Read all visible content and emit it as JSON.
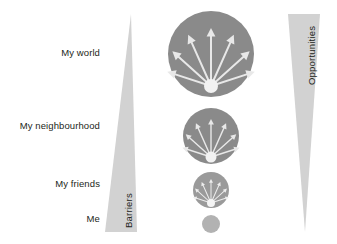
{
  "diagram": {
    "background_color": "#ffffff",
    "labels": {
      "my_world": "My world",
      "my_neighbourhood": "My neighbourhood",
      "my_friends": "My friends",
      "me": "Me"
    },
    "triangles": {
      "barriers": {
        "label": "Barriers",
        "color": "#d2d2d2",
        "orientation": "apex-top",
        "description": "narrow at top, widening toward bottom"
      },
      "opportunities": {
        "label": "Opportunities",
        "color": "#d2d2d2",
        "orientation": "apex-bottom",
        "description": "wide at top, narrowing toward bottom"
      }
    },
    "circles": [
      {
        "level": "my-world",
        "cx": 211,
        "cy": 54,
        "r": 43,
        "color": "#8a8a8a",
        "arrow_count": 7,
        "arrow_color": "#e8e8e8",
        "hub_color": "#f2f2f2",
        "has_arrows": true
      },
      {
        "level": "my-neighbourhood",
        "cx": 211,
        "cy": 136,
        "r": 28,
        "color": "#8a8a8a",
        "arrow_count": 7,
        "arrow_color": "#e8e8e8",
        "hub_color": "#f2f2f2",
        "has_arrows": true
      },
      {
        "level": "my-friends",
        "cx": 211,
        "cy": 190,
        "r": 18,
        "color": "#9a9a9a",
        "arrow_count": 7,
        "arrow_color": "#ededed",
        "hub_color": "#f4f4f4",
        "has_arrows": true
      },
      {
        "level": "me",
        "cx": 211,
        "cy": 224,
        "r": 9,
        "color": "#b2b2b2",
        "arrow_count": 0,
        "arrow_color": "#ffffff",
        "hub_color": "#ffffff",
        "has_arrows": false
      }
    ]
  },
  "colors": {
    "triangle_gray": "#d2d2d2",
    "circle_gray": "#8a8a8a",
    "arrow_white": "#e8e8e8",
    "text_dark": "#231f20",
    "page_white": "#ffffff"
  }
}
